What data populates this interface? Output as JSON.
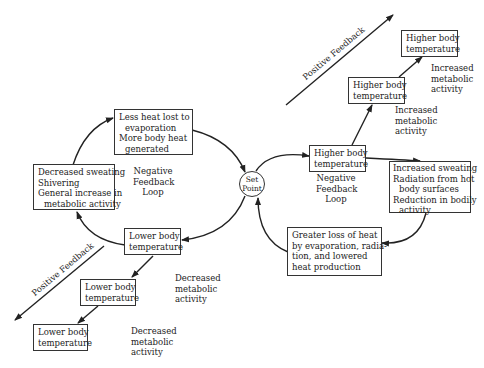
{
  "set_point": {
    "line1": "Set",
    "line2": "Point"
  },
  "left_loop": {
    "label": [
      "Negative",
      "Feedback",
      "Loop"
    ],
    "boxes": {
      "top": [
        "Less heat lost to",
        "evaporation",
        "More body heat",
        "generated"
      ],
      "left": [
        "Decreased sweating",
        "Shivering",
        "General increase in",
        "metabolic activity"
      ],
      "bottom": [
        "Lower body",
        "temperature"
      ]
    }
  },
  "right_loop": {
    "label": [
      "Negative",
      "Feedback",
      "Loop"
    ],
    "boxes": {
      "top": [
        "Higher body",
        "temperature"
      ],
      "right": [
        "Increased sweating",
        "Radiation from hot",
        "body surfaces",
        "Reduction in bodily",
        "activity"
      ],
      "bottom": [
        "Greater loss of heat",
        "by evaporation, radia-",
        "tion, and lowered",
        "heat production"
      ]
    }
  },
  "positive_up": {
    "label": "Positive Feedback",
    "boxes": [
      [
        "Higher body",
        "temperature"
      ],
      [
        "Higher body",
        "temperature"
      ]
    ],
    "notes": [
      [
        "Increased",
        "metabolic",
        "activity"
      ],
      [
        "Increased",
        "metabolic",
        "activity"
      ]
    ]
  },
  "positive_down": {
    "label": "Positive Feedback",
    "boxes": [
      [
        "Lower body",
        "temperature"
      ],
      [
        "Lower body",
        "temperature"
      ]
    ],
    "notes": [
      [
        "Decreased",
        "metabolic",
        "activity"
      ],
      [
        "Decreased",
        "metabolic",
        "activity"
      ]
    ]
  }
}
